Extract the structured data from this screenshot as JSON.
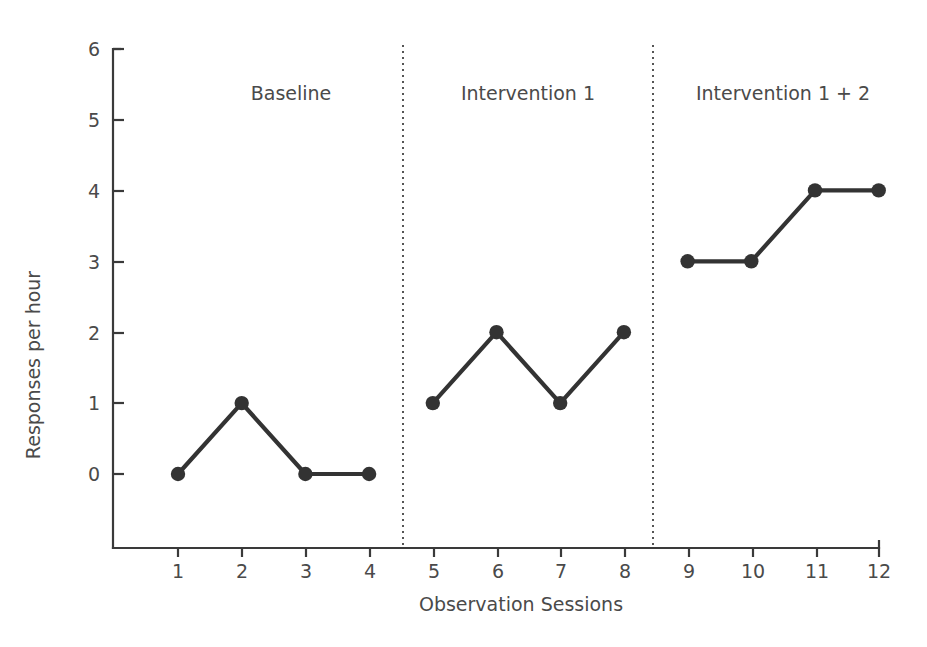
{
  "chart_data": {
    "type": "line",
    "title": "",
    "xlabel": "Observation Sessions",
    "ylabel": "Responses per hour",
    "x": [
      1,
      2,
      3,
      4,
      5,
      6,
      7,
      8,
      9,
      10,
      11,
      12
    ],
    "xticklabels": [
      "1",
      "2",
      "3",
      "4",
      "5",
      "6",
      "7",
      "8",
      "9",
      "10",
      "11",
      "12"
    ],
    "yticklabels": [
      "0",
      "1",
      "2",
      "3",
      "4",
      "5",
      "6"
    ],
    "yticks": [
      0,
      1,
      2,
      3,
      4,
      5,
      6
    ],
    "xlim": [
      0.5,
      12.5
    ],
    "ylim": [
      0,
      6
    ],
    "grid": false,
    "legend": null,
    "series": [
      {
        "name": "Responses per hour",
        "values": [
          0,
          1,
          0,
          0,
          1,
          2,
          1,
          2,
          3,
          3,
          4,
          4
        ],
        "color": "#333333",
        "marker": "circle"
      }
    ],
    "phases": [
      {
        "label": "Baseline",
        "sessions": [
          1,
          2,
          3,
          4
        ],
        "values": [
          0,
          1,
          0,
          0
        ],
        "label_center_x": 291
      },
      {
        "label": "Intervention 1",
        "sessions": [
          5,
          6,
          7,
          8
        ],
        "values": [
          1,
          2,
          1,
          2
        ],
        "label_center_x": 528
      },
      {
        "label": "Intervention 1 + 2",
        "sessions": [
          9,
          10,
          11,
          12
        ],
        "values": [
          3,
          3,
          4,
          4
        ],
        "label_center_x": 783
      }
    ],
    "phase_dividers": [
      4.5,
      8.5
    ],
    "annotations": []
  },
  "style": {
    "line_color": "#333333",
    "marker_color": "#333333",
    "axis_color": "#3a3a3a",
    "text_color": "#4a4a4a",
    "divider_color": "#555555",
    "background": "#ffffff"
  }
}
